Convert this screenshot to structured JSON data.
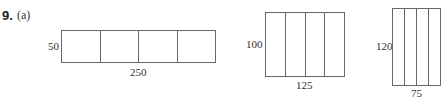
{
  "problem": {
    "number": "9.",
    "part": "(a)"
  },
  "figures": [
    {
      "height_label": "50",
      "width_label": "250",
      "divisions": 4
    },
    {
      "height_label": "100",
      "width_label": "125",
      "divisions": 4
    },
    {
      "height_label": "120",
      "width_label": "75",
      "divisions": 4
    }
  ]
}
